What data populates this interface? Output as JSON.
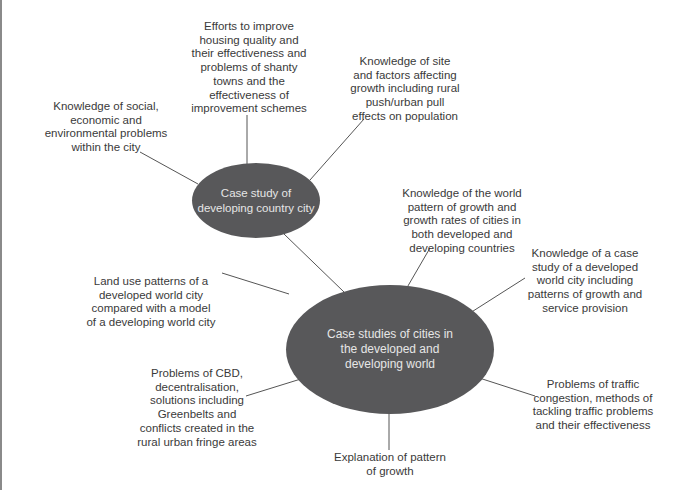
{
  "diagram": {
    "type": "mind-map",
    "colors": {
      "node_fill": "#58585a",
      "node_text": "#e6e6e6",
      "label_text": "#3a3a3a",
      "line": "#555555"
    },
    "nodes": {
      "developing_city": {
        "label": "Case study of developing country city"
      },
      "cities_world": {
        "label": "Case studies of cities in the developed and developing world"
      }
    },
    "labels": {
      "social_problems": "Knowledge of social, economic and environmental problems within the city",
      "housing": "Efforts to improve housing quality and their effectiveness and problems of shanty towns and the effectiveness of improvement schemes",
      "site_factors": "Knowledge of site and factors affecting growth including rural push/urban pull effects on population",
      "world_pattern": "Knowledge of the world pattern of growth and growth rates of cities in both developed and developing countries",
      "developed_case": "Knowledge of a case study of a developed world city including patterns of growth and service provision",
      "land_use": "Land use patterns of a developed world city compared with a model of a developing world city",
      "cbd": "Problems of CBD, decentralisation, solutions including Greenbelts and conflicts created in the rural urban fringe areas",
      "traffic": "Problems of traffic congestion, methods of tackling traffic problems and their effectiveness",
      "explanation": "Explanation of pattern of growth"
    }
  }
}
